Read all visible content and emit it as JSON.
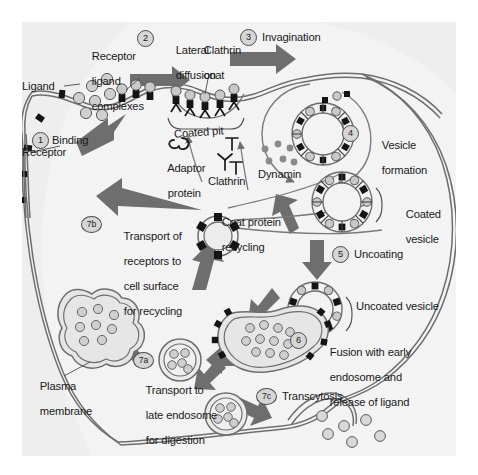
{
  "figure": {
    "background_color": "#eeeeee",
    "cell_interior_color": "#f2f2f2",
    "membrane_color": "#6b6b6b",
    "arrow_color": "#6e6e6e",
    "coat_dark_color": "#1a1a1a",
    "ligand_color": "#c9c9c9",
    "text_color": "#1a1a1a"
  },
  "steps": [
    {
      "id": "1",
      "num": "1",
      "label": "Binding"
    },
    {
      "id": "2",
      "num": "2",
      "label": "Lateral\ndiffusion"
    },
    {
      "id": "3",
      "num": "3",
      "label": "Invagination"
    },
    {
      "id": "4",
      "num": "4",
      "label": "Vesicle\nformation"
    },
    {
      "id": "5",
      "num": "5",
      "label": "Uncoating"
    },
    {
      "id": "6",
      "num": "6",
      "label": "Fusion with early\nendosome and\nrelease of ligand"
    },
    {
      "id": "7a",
      "num": "7a",
      "label": "Transport to\nlate endosome\nfor digestion"
    },
    {
      "id": "7b",
      "num": "7b",
      "label": "Transport of\nreceptors to\ncell surface\nfor recycling"
    },
    {
      "id": "7c",
      "num": "7c",
      "label": "Transcytosis"
    }
  ],
  "labels": {
    "ligand": "Ligand",
    "receptor": "Receptor",
    "receptor_ligand_complexes": "Receptor\nligand\ncomplexes",
    "clathrin_coat": "Clathrin\ncoat",
    "coated_pit": "Coated pit",
    "adaptor_protein": "Adaptor\nprotein",
    "clathrin": "Clathrin",
    "dynamin": "Dynamin",
    "coat_protein_recycling": "Coat protein\nrecycling",
    "coated_vesicle": "Coated\nvesicle",
    "uncoated_vesicle": "Uncoated vesicle",
    "plasma_membrane": "Plasma\nmembrane"
  },
  "step_numbers": {
    "s1": "1",
    "s2": "2",
    "s3": "3",
    "s4": "4",
    "s5": "5",
    "s6": "6",
    "s7a": "7a",
    "s7b": "7b",
    "s7c": "7c"
  },
  "step_labels": {
    "binding": "Binding",
    "lateral_diffusion_l1": "Lateral",
    "lateral_diffusion_l2": "diffusion",
    "invagination": "Invagination",
    "vesicle_formation_l1": "Vesicle",
    "vesicle_formation_l2": "formation",
    "uncoating": "Uncoating",
    "fusion_l1": "Fusion with early",
    "fusion_l2": "endosome and",
    "fusion_l3": "release of ligand",
    "transport_late_l1": "Transport to",
    "transport_late_l2": "late endosome",
    "transport_late_l3": "for digestion",
    "transport_surface_l1": "Transport of",
    "transport_surface_l2": "receptors to",
    "transport_surface_l3": "cell surface",
    "transport_surface_l4": "for recycling",
    "transcytosis": "Transcytosis"
  },
  "structure_labels": {
    "ligand": "Ligand",
    "receptor": "Receptor",
    "rlc_l1": "Receptor",
    "rlc_l2": "ligand",
    "rlc_l3": "complexes",
    "clathrin_coat_l1": "Clathrin",
    "clathrin_coat_l2": "coat",
    "coated_pit": "Coated pit",
    "adaptor_l1": "Adaptor",
    "adaptor_l2": "protein",
    "clathrin": "Clathrin",
    "dynamin": "Dynamin",
    "recycling_l1": "Coat protein",
    "recycling_l2": "recycling",
    "coated_vesicle_l1": "Coated",
    "coated_vesicle_l2": "vesicle",
    "uncoated_vesicle": "Uncoated vesicle",
    "plasma_l1": "Plasma",
    "plasma_l2": "membrane"
  }
}
